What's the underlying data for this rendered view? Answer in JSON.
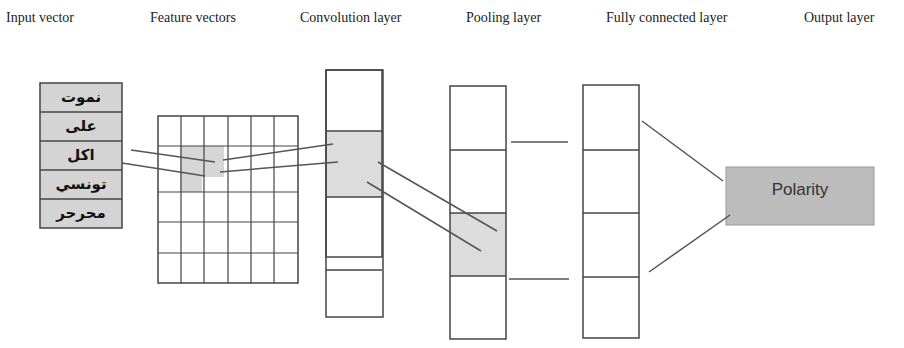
{
  "headers": [
    {
      "label": "Input vector",
      "x": 6
    },
    {
      "label": "Feature vectors",
      "x": 150
    },
    {
      "label": "Convolution layer",
      "x": 300
    },
    {
      "label": "Pooling layer",
      "x": 466
    },
    {
      "label": "Fully connected layer",
      "x": 606
    },
    {
      "label": "Output layer",
      "x": 804
    }
  ],
  "input_words": [
    "نموت",
    "على",
    "اكل",
    "تونسي",
    "محرحر"
  ],
  "output": {
    "label": "Polarity"
  },
  "colors": {
    "shaded": "#d9d9d9",
    "output_box": "#b8b8b8",
    "stroke": "#444444"
  },
  "feature_grid": {
    "rows": 6,
    "cols": 6,
    "highlighted": [
      [
        1,
        1
      ],
      [
        1,
        2
      ],
      [
        2,
        1
      ]
    ]
  },
  "convolution_cells": 4,
  "pooling_cells": 4,
  "fully_connected_cells": 4
}
